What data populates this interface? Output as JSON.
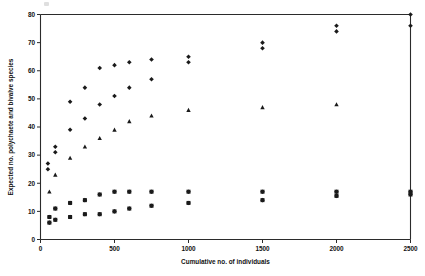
{
  "chart_data": {
    "type": "scatter",
    "title": "",
    "xlabel": "Cumulative no. of individuals",
    "ylabel": "Expected no. polychaete and bivalve species",
    "xlim": [
      0,
      2500
    ],
    "ylim": [
      0,
      80
    ],
    "xticks": [
      0,
      500,
      1000,
      1500,
      2000,
      2500
    ],
    "yticks": [
      0,
      10,
      20,
      30,
      40,
      50,
      60,
      70,
      80
    ],
    "xtick_labels": [
      "0",
      "500",
      "1000",
      "1500",
      "2000",
      "2500"
    ],
    "ytick_labels": [
      "0",
      "10",
      "20",
      "30",
      "40",
      "50",
      "60",
      "70",
      "80"
    ],
    "grid": false,
    "legend": "none",
    "series": [
      {
        "name": "diamond-series",
        "marker": "diamond",
        "color": "#1a1a1a",
        "points": [
          [
            50,
            27
          ],
          [
            50,
            25
          ],
          [
            60,
            8
          ],
          [
            60,
            6
          ],
          [
            100,
            33
          ],
          [
            100,
            31
          ],
          [
            100,
            11
          ],
          [
            100,
            7
          ],
          [
            200,
            49
          ],
          [
            200,
            39
          ],
          [
            200,
            13
          ],
          [
            200,
            8
          ],
          [
            300,
            54
          ],
          [
            300,
            43
          ],
          [
            300,
            14
          ],
          [
            300,
            9
          ],
          [
            400,
            61
          ],
          [
            400,
            48
          ],
          [
            400,
            16
          ],
          [
            400,
            9
          ],
          [
            500,
            62
          ],
          [
            500,
            51
          ],
          [
            500,
            17
          ],
          [
            500,
            10
          ],
          [
            600,
            63
          ],
          [
            600,
            54
          ],
          [
            600,
            17
          ],
          [
            600,
            11
          ],
          [
            750,
            64
          ],
          [
            750,
            57
          ],
          [
            750,
            17
          ],
          [
            750,
            12
          ],
          [
            1000,
            65
          ],
          [
            1000,
            63
          ],
          [
            1000,
            17
          ],
          [
            1000,
            13
          ],
          [
            1500,
            70
          ],
          [
            1500,
            68
          ],
          [
            1500,
            17
          ],
          [
            1500,
            14
          ],
          [
            2000,
            76
          ],
          [
            2000,
            74
          ],
          [
            2000,
            17
          ],
          [
            2000,
            15.5
          ],
          [
            2500,
            80
          ],
          [
            2500,
            76
          ],
          [
            2500,
            17
          ],
          [
            2500,
            16
          ]
        ]
      },
      {
        "name": "triangle-series",
        "marker": "triangle",
        "color": "#1a1a1a",
        "points": [
          [
            60,
            17
          ],
          [
            100,
            23
          ],
          [
            200,
            29
          ],
          [
            300,
            33
          ],
          [
            400,
            36
          ],
          [
            500,
            39
          ],
          [
            600,
            42
          ],
          [
            750,
            44
          ],
          [
            1000,
            46
          ],
          [
            1500,
            47
          ],
          [
            2000,
            48
          ]
        ]
      },
      {
        "name": "square-series",
        "marker": "square",
        "color": "#1a1a1a",
        "points": [
          [
            60,
            8
          ],
          [
            60,
            6
          ],
          [
            100,
            11
          ],
          [
            100,
            7
          ],
          [
            200,
            13
          ],
          [
            200,
            8
          ],
          [
            300,
            14
          ],
          [
            300,
            9
          ],
          [
            400,
            16
          ],
          [
            400,
            9
          ],
          [
            500,
            17
          ],
          [
            500,
            10
          ],
          [
            600,
            17
          ],
          [
            600,
            11
          ],
          [
            750,
            17
          ],
          [
            750,
            12
          ],
          [
            1000,
            17
          ],
          [
            1000,
            13
          ],
          [
            1500,
            17
          ],
          [
            1500,
            14
          ],
          [
            2000,
            17
          ],
          [
            2000,
            15.5
          ],
          [
            2500,
            17
          ],
          [
            2500,
            16
          ]
        ]
      }
    ]
  }
}
